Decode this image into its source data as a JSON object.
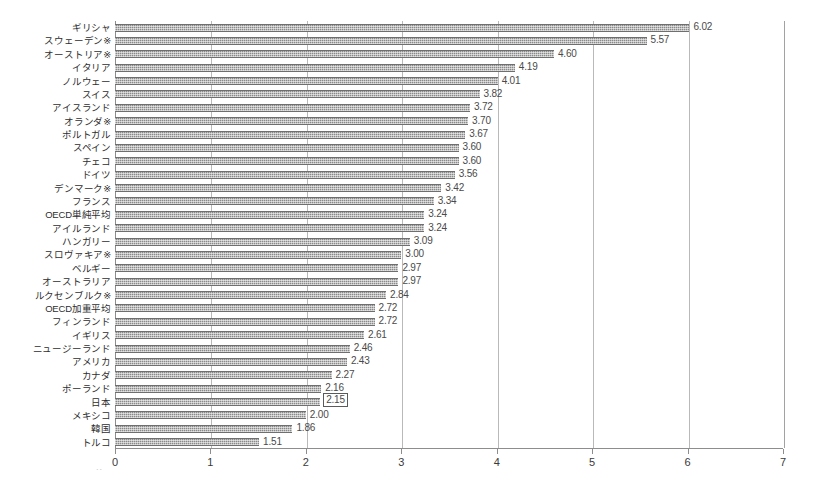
{
  "chart_data": {
    "type": "bar",
    "orientation": "horizontal",
    "title": "",
    "subtitle": "",
    "xlabel": "",
    "ylabel": "",
    "xlim": [
      0,
      7
    ],
    "xticks": [
      "0",
      "1",
      "2",
      "3",
      "4",
      "5",
      "6",
      "7"
    ],
    "grid": "vertical",
    "legend": "none",
    "value_label_format": "2 decimals",
    "categories": [
      "ギリシャ",
      "スウェーデン※",
      "オーストリア※",
      "イタリア",
      "ノルウェー",
      "スイス",
      "アイスランド",
      "オランダ※",
      "ポルトガル",
      "スペイン",
      "チェコ",
      "ドイツ",
      "デンマーク※",
      "フランス",
      "OECD単純平均",
      "アイルランド",
      "ハンガリー",
      "スロヴァキア※",
      "ベルギー",
      "オーストラリア",
      "ルクセンブルク※",
      "OECD加重平均",
      "フィンランド",
      "イギリス",
      "ニュージーランド",
      "アメリカ",
      "カナダ",
      "ポーランド",
      "日本",
      "メキシコ",
      "韓国",
      "トルコ"
    ],
    "values": [
      6.02,
      5.57,
      4.6,
      4.19,
      4.01,
      3.82,
      3.72,
      3.7,
      3.67,
      3.6,
      3.6,
      3.56,
      3.42,
      3.34,
      3.24,
      3.24,
      3.09,
      3.0,
      2.97,
      2.97,
      2.84,
      2.72,
      2.72,
      2.61,
      2.46,
      2.43,
      2.27,
      2.16,
      2.15,
      2.0,
      1.86,
      1.51
    ],
    "value_labels": [
      "6.02",
      "5.57",
      "4.60",
      "4.19",
      "4.01",
      "3.82",
      "3.72",
      "3.70",
      "3.67",
      "3.60",
      "3.60",
      "3.56",
      "3.42",
      "3.34",
      "3.24",
      "3.24",
      "3.09",
      "3.00",
      "2.97",
      "2.97",
      "2.84",
      "2.72",
      "2.72",
      "2.61",
      "2.46",
      "2.43",
      "2.27",
      "2.16",
      "2.15",
      "2.00",
      "1.86",
      "1.51"
    ],
    "highlighted_categories": [
      "日本"
    ],
    "colors": {
      "bar_fill": "#8a8a8a",
      "bar_edge": "#6f6f6f",
      "gridline": "#b9b9b9",
      "axis": "#8d8d8d",
      "text": "#2e2e2e",
      "value_text": "#4a4a4a",
      "highlight_box": "#5a5a5a",
      "background": "#ffffff"
    }
  },
  "artifact": {
    "mark": ".."
  }
}
